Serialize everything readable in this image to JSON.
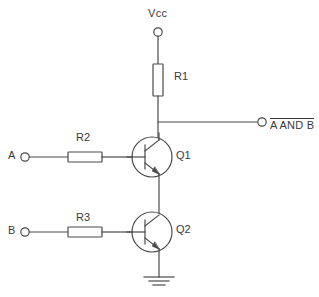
{
  "diagram": {
    "stroke_color": "#4a4a4a",
    "text_color": "#3a3a3a",
    "background": "#ffffff"
  },
  "labels": {
    "vcc": "Vcc",
    "r1": "R1",
    "r2": "R2",
    "r3": "R3",
    "q1": "Q1",
    "q2": "Q2",
    "input_a": "A",
    "input_b": "B",
    "output": "A AND B",
    "output_overline": true,
    "ground": "ground"
  },
  "components": [
    {
      "ref": "R1",
      "type": "resistor",
      "orientation": "vertical",
      "label": "R1"
    },
    {
      "ref": "R2",
      "type": "resistor",
      "orientation": "horizontal",
      "label": "R2"
    },
    {
      "ref": "R3",
      "type": "resistor",
      "orientation": "horizontal",
      "label": "R3"
    },
    {
      "ref": "Q1",
      "type": "npn-transistor",
      "label": "Q1"
    },
    {
      "ref": "Q2",
      "type": "npn-transistor",
      "label": "Q2"
    }
  ],
  "terminals": [
    {
      "ref": "VCC",
      "label": "Vcc",
      "shape": "open-circle"
    },
    {
      "ref": "A",
      "label": "A",
      "shape": "open-circle"
    },
    {
      "ref": "B",
      "label": "B",
      "shape": "open-circle"
    },
    {
      "ref": "OUT",
      "label": "A AND B",
      "shape": "open-circle"
    }
  ]
}
